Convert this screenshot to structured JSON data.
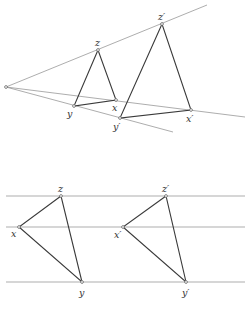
{
  "colors": {
    "background": "#ffffff",
    "thin_line": "#8a8a8a",
    "triangle_edge": "#3a3a3a",
    "point": "#555555"
  },
  "top_figure": {
    "origin": {
      "x": 6,
      "y": 87
    },
    "rays": [
      {
        "name": "upper-ray",
        "to": {
          "x": 207,
          "y": 5
        }
      },
      {
        "name": "middle-ray",
        "to": {
          "x": 245,
          "y": 117
        }
      },
      {
        "name": "lower-ray",
        "to": {
          "x": 173,
          "y": 132
        }
      }
    ],
    "small_triangle": {
      "z": {
        "label": "z",
        "x": 98,
        "y": 50
      },
      "y": {
        "label": "y",
        "x": 74,
        "y": 106
      },
      "x": {
        "label": "x",
        "x": 116,
        "y": 100
      }
    },
    "large_triangle": {
      "z": {
        "label": "z′",
        "x": 162,
        "y": 24
      },
      "y": {
        "label": "y′",
        "x": 120,
        "y": 118
      },
      "x": {
        "label": "x′",
        "x": 191,
        "y": 110
      }
    }
  },
  "bottom_figure": {
    "horizontal_lines_y": [
      196,
      227,
      282
    ],
    "left_triangle": {
      "z": {
        "label": "z",
        "x": 61,
        "y": 196
      },
      "x": {
        "label": "x",
        "x": 19,
        "y": 227
      },
      "y": {
        "label": "y",
        "x": 82,
        "y": 282
      }
    },
    "right_triangle": {
      "z": {
        "label": "z′",
        "x": 166,
        "y": 196
      },
      "x": {
        "label": "x′",
        "x": 123,
        "y": 227
      },
      "y": {
        "label": "y′",
        "x": 186,
        "y": 282
      }
    }
  }
}
